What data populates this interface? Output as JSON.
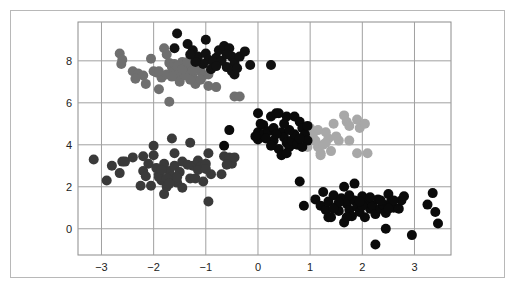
{
  "chart_data": {
    "type": "scatter",
    "title": "",
    "xlabel": "",
    "ylabel": "",
    "xlim": [
      -3.45,
      3.7
    ],
    "ylim": [
      -1.25,
      9.85
    ],
    "grid": true,
    "legend": null,
    "x_ticks": [
      -3,
      -2,
      -1,
      0,
      1,
      2,
      3
    ],
    "x_tick_labels": [
      "−3",
      "−2",
      "−1",
      "0",
      "1",
      "2",
      "3"
    ],
    "y_ticks": [
      0,
      2,
      4,
      6,
      8
    ],
    "y_tick_labels": [
      "0",
      "2",
      "4",
      "6",
      "8"
    ],
    "marker_radius": 5,
    "series": [
      {
        "name": "cluster-upper-left",
        "color": "#6f6f6f",
        "points": [
          [
            -2.65,
            8.35
          ],
          [
            -2.6,
            8.05
          ],
          [
            -2.62,
            7.85
          ],
          [
            -2.4,
            7.5
          ],
          [
            -2.3,
            7.4
          ],
          [
            -2.2,
            7.3
          ],
          [
            -2.15,
            6.9
          ],
          [
            -2.05,
            8.1
          ],
          [
            -2.0,
            7.5
          ],
          [
            -1.95,
            7.45
          ],
          [
            -1.9,
            6.65
          ],
          [
            -1.8,
            8.6
          ],
          [
            -1.75,
            8.3
          ],
          [
            -1.7,
            7.9
          ],
          [
            -1.65,
            7.7
          ],
          [
            -1.6,
            7.55
          ],
          [
            -1.55,
            7.4
          ],
          [
            -1.5,
            7.2
          ],
          [
            -1.45,
            7.95
          ],
          [
            -1.4,
            7.8
          ],
          [
            -1.35,
            7.6
          ],
          [
            -1.3,
            7.4
          ],
          [
            -1.25,
            7.25
          ],
          [
            -1.2,
            7.9
          ],
          [
            -1.15,
            7.7
          ],
          [
            -1.1,
            7.5
          ],
          [
            -1.05,
            7.3
          ],
          [
            -1.2,
            6.9
          ],
          [
            -1.7,
            6.05
          ],
          [
            -1.5,
            7.0
          ],
          [
            -1.6,
            7.85
          ],
          [
            -1.4,
            7.3
          ],
          [
            -0.95,
            7.35
          ],
          [
            -0.95,
            6.8
          ],
          [
            -0.8,
            6.75
          ],
          [
            -0.45,
            6.3
          ],
          [
            -0.35,
            6.3
          ],
          [
            -1.85,
            7.2
          ],
          [
            -1.55,
            7.75
          ],
          [
            -1.3,
            7.1
          ],
          [
            -1.75,
            7.35
          ],
          [
            -1.45,
            7.6
          ],
          [
            -1.25,
            7.55
          ],
          [
            -1.9,
            7.5
          ],
          [
            -2.35,
            7.15
          ],
          [
            -1.65,
            7.25
          ],
          [
            -1.35,
            7.95
          ],
          [
            -1.1,
            7.1
          ]
        ]
      },
      {
        "name": "cluster-upper-center",
        "color": "#111111",
        "points": [
          [
            -1.55,
            9.3
          ],
          [
            -1.6,
            8.6
          ],
          [
            -1.35,
            8.8
          ],
          [
            -1.25,
            8.5
          ],
          [
            -1.15,
            8.2
          ],
          [
            -1.0,
            8.35
          ],
          [
            -0.95,
            8.05
          ],
          [
            -0.8,
            8.15
          ],
          [
            -0.75,
            8.5
          ],
          [
            -0.65,
            8.7
          ],
          [
            -0.55,
            8.6
          ],
          [
            -0.5,
            8.2
          ],
          [
            -0.45,
            7.9
          ],
          [
            -0.35,
            8.2
          ],
          [
            -0.25,
            8.45
          ],
          [
            -0.85,
            7.95
          ],
          [
            -1.05,
            7.85
          ],
          [
            -1.2,
            7.95
          ],
          [
            -0.9,
            7.6
          ],
          [
            -0.6,
            7.7
          ],
          [
            -0.5,
            7.5
          ],
          [
            -0.45,
            7.35
          ],
          [
            -0.4,
            7.65
          ],
          [
            -0.15,
            7.8
          ],
          [
            0.25,
            7.8
          ],
          [
            -1.3,
            8.3
          ],
          [
            -0.7,
            8.0
          ],
          [
            -1.0,
            9.0
          ],
          [
            -0.8,
            7.75
          ],
          [
            -0.6,
            8.3
          ]
        ]
      },
      {
        "name": "cluster-lower-left",
        "color": "#3a3a3a",
        "points": [
          [
            -3.15,
            3.3
          ],
          [
            -2.9,
            2.3
          ],
          [
            -2.8,
            3.0
          ],
          [
            -2.65,
            2.65
          ],
          [
            -2.6,
            3.2
          ],
          [
            -2.55,
            3.2
          ],
          [
            -2.4,
            3.4
          ],
          [
            -2.2,
            3.45
          ],
          [
            -2.2,
            2.75
          ],
          [
            -2.15,
            2.5
          ],
          [
            -2.1,
            3.1
          ],
          [
            -2.05,
            2.05
          ],
          [
            -2.0,
            3.5
          ],
          [
            -1.95,
            2.9
          ],
          [
            -1.9,
            2.6
          ],
          [
            -1.85,
            2.3
          ],
          [
            -1.8,
            3.1
          ],
          [
            -1.8,
            1.65
          ],
          [
            -1.75,
            2.0
          ],
          [
            -1.7,
            2.75
          ],
          [
            -1.65,
            2.5
          ],
          [
            -1.6,
            3.6
          ],
          [
            -1.6,
            3.0
          ],
          [
            -1.55,
            2.2
          ],
          [
            -1.5,
            2.7
          ],
          [
            -1.45,
            3.2
          ],
          [
            -1.45,
            1.95
          ],
          [
            -1.3,
            2.4
          ],
          [
            -1.25,
            3.0
          ],
          [
            -1.2,
            2.4
          ],
          [
            -1.15,
            3.25
          ],
          [
            -1.1,
            2.95
          ],
          [
            -1.05,
            2.25
          ],
          [
            -1.0,
            3.1
          ],
          [
            -0.95,
            3.6
          ],
          [
            -0.9,
            2.6
          ],
          [
            -1.3,
            4.1
          ],
          [
            -1.65,
            4.3
          ],
          [
            -2.0,
            3.95
          ],
          [
            -0.95,
            1.3
          ],
          [
            -0.7,
            2.6
          ],
          [
            -0.65,
            3.45
          ],
          [
            -0.5,
            3.1
          ],
          [
            -0.55,
            3.4
          ],
          [
            -1.9,
            2.45
          ],
          [
            -1.75,
            2.4
          ],
          [
            -1.7,
            2.15
          ],
          [
            -1.85,
            2.8
          ],
          [
            -1.35,
            3.05
          ],
          [
            -1.15,
            2.8
          ],
          [
            -1.0,
            2.85
          ],
          [
            -0.45,
            3.4
          ],
          [
            -2.25,
            2.05
          ],
          [
            -1.55,
            2.45
          ],
          [
            -0.6,
            3.05
          ]
        ]
      },
      {
        "name": "cluster-right-middle",
        "color": "#a8a8a8",
        "points": [
          [
            1.0,
            4.8
          ],
          [
            1.05,
            4.5
          ],
          [
            1.1,
            4.2
          ],
          [
            1.15,
            3.9
          ],
          [
            1.2,
            3.6
          ],
          [
            1.25,
            4.0
          ],
          [
            1.3,
            4.6
          ],
          [
            1.35,
            4.3
          ],
          [
            1.4,
            3.7
          ],
          [
            1.45,
            5.0
          ],
          [
            1.55,
            4.2
          ],
          [
            1.65,
            5.4
          ],
          [
            1.7,
            5.1
          ],
          [
            1.75,
            4.9
          ],
          [
            1.9,
            5.2
          ],
          [
            1.95,
            4.8
          ],
          [
            2.05,
            5.0
          ],
          [
            1.75,
            4.2
          ],
          [
            1.9,
            3.6
          ],
          [
            2.1,
            3.6
          ],
          [
            1.2,
            3.5
          ],
          [
            0.95,
            3.9
          ],
          [
            1.3,
            4.1
          ],
          [
            1.5,
            4.4
          ],
          [
            1.15,
            4.7
          ]
        ]
      },
      {
        "name": "cluster-center",
        "color": "#0a0a0a",
        "points": [
          [
            -0.65,
            3.95
          ],
          [
            -0.55,
            4.7
          ],
          [
            0.0,
            5.5
          ],
          [
            0.0,
            4.6
          ],
          [
            0.0,
            4.25
          ],
          [
            0.1,
            4.95
          ],
          [
            0.25,
            5.35
          ],
          [
            0.35,
            5.5
          ],
          [
            0.4,
            5.5
          ],
          [
            0.55,
            5.35
          ],
          [
            0.7,
            5.35
          ],
          [
            0.8,
            5.1
          ],
          [
            0.85,
            4.8
          ],
          [
            0.9,
            4.5
          ],
          [
            0.95,
            4.2
          ],
          [
            0.1,
            4.5
          ],
          [
            0.2,
            4.65
          ],
          [
            0.3,
            4.8
          ],
          [
            0.45,
            4.6
          ],
          [
            0.5,
            4.35
          ],
          [
            0.55,
            4.1
          ],
          [
            0.6,
            3.9
          ],
          [
            0.65,
            4.2
          ],
          [
            0.7,
            4.5
          ],
          [
            0.4,
            3.8
          ],
          [
            0.45,
            3.5
          ],
          [
            0.55,
            3.6
          ],
          [
            0.3,
            4.2
          ],
          [
            0.15,
            4.3
          ],
          [
            0.75,
            4.0
          ],
          [
            0.85,
            3.9
          ],
          [
            0.6,
            4.7
          ],
          [
            0.35,
            4.5
          ],
          [
            -0.05,
            4.4
          ],
          [
            0.05,
            5.0
          ],
          [
            0.5,
            5.0
          ],
          [
            0.8,
            4.3
          ],
          [
            0.25,
            3.95
          ],
          [
            0.95,
            4.9
          ]
        ]
      },
      {
        "name": "cluster-lower-right",
        "color": "#0a0a0a",
        "points": [
          [
            0.8,
            2.25
          ],
          [
            0.88,
            1.1
          ],
          [
            1.1,
            1.4
          ],
          [
            1.2,
            1.1
          ],
          [
            1.25,
            1.75
          ],
          [
            1.3,
            0.9
          ],
          [
            1.35,
            1.3
          ],
          [
            1.35,
            0.55
          ],
          [
            1.45,
            1.6
          ],
          [
            1.5,
            1.05
          ],
          [
            1.55,
            0.85
          ],
          [
            1.6,
            1.45
          ],
          [
            1.65,
            0.3
          ],
          [
            1.65,
            2.0
          ],
          [
            1.7,
            1.2
          ],
          [
            1.75,
            0.9
          ],
          [
            1.8,
            0.6
          ],
          [
            1.85,
            1.35
          ],
          [
            1.85,
            2.15
          ],
          [
            1.9,
            1.05
          ],
          [
            1.95,
            0.8
          ],
          [
            2.0,
            1.55
          ],
          [
            2.05,
            0.55
          ],
          [
            2.1,
            1.25
          ],
          [
            2.15,
            0.95
          ],
          [
            2.2,
            1.1
          ],
          [
            2.25,
            0.7
          ],
          [
            2.3,
            1.4
          ],
          [
            2.35,
            0.95
          ],
          [
            2.4,
            1.15
          ],
          [
            2.45,
            0.75
          ],
          [
            2.5,
            1.65
          ],
          [
            2.55,
            1.3
          ],
          [
            2.6,
            1.0
          ],
          [
            2.7,
            0.95
          ],
          [
            2.75,
            1.35
          ],
          [
            2.8,
            1.55
          ],
          [
            2.25,
            -0.75
          ],
          [
            2.45,
            0.0
          ],
          [
            2.95,
            -0.3
          ],
          [
            3.25,
            1.15
          ],
          [
            3.35,
            1.7
          ],
          [
            3.4,
            0.8
          ],
          [
            3.45,
            0.25
          ],
          [
            1.4,
            0.55
          ],
          [
            2.0,
            1.1
          ],
          [
            2.15,
            1.5
          ],
          [
            1.55,
            1.25
          ],
          [
            1.75,
            1.6
          ],
          [
            1.95,
            1.3
          ],
          [
            2.35,
            1.35
          ],
          [
            2.6,
            1.35
          ],
          [
            1.45,
            0.95
          ],
          [
            1.7,
            0.55
          ],
          [
            2.5,
            0.95
          ]
        ]
      }
    ]
  }
}
